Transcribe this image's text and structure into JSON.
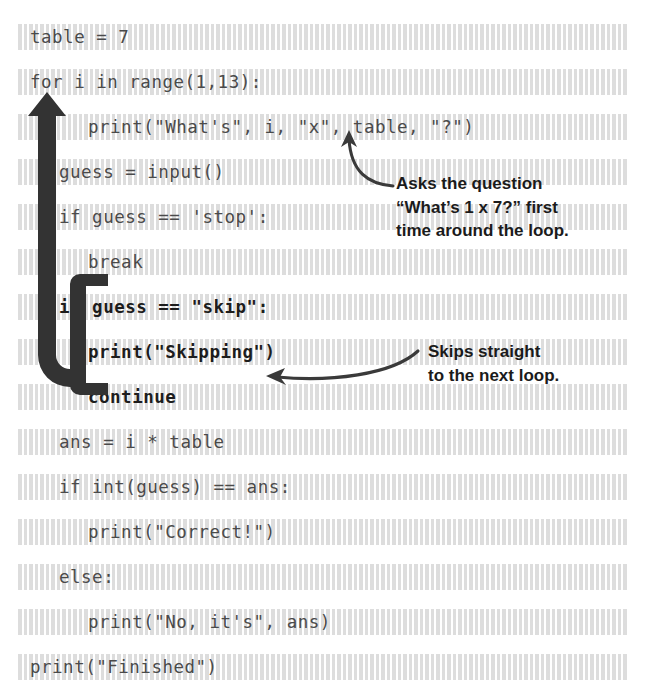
{
  "figure": {
    "kind": "annotated-code-listing",
    "language": "Python",
    "background": "#ffffff",
    "code_color": "#4a4a4a",
    "highlight_color": "#d7d7d7",
    "annotation_color": "#1b1b1b",
    "arrow_color": "#333333"
  },
  "code": {
    "lines": [
      {
        "text": "table = 7",
        "indent": 0,
        "bold": false
      },
      {
        "text": "for i in range(1,13):",
        "indent": 0,
        "bold": false
      },
      {
        "text": "print(\"What's\", i, \"x\", table, \"?\")",
        "indent": 2,
        "bold": false
      },
      {
        "text": "guess = input()",
        "indent": 1,
        "bold": false
      },
      {
        "text": "if guess == 'stop':",
        "indent": 1,
        "bold": false
      },
      {
        "text": "break",
        "indent": 2,
        "bold": false
      },
      {
        "text": "if guess == \"skip\":",
        "indent": 1,
        "bold": true
      },
      {
        "text": "print(\"Skipping\")",
        "indent": 2,
        "bold": true
      },
      {
        "text": "continue",
        "indent": 2,
        "bold": true
      },
      {
        "text": "ans = i * table",
        "indent": 1,
        "bold": false
      },
      {
        "text": "if int(guess) == ans:",
        "indent": 1,
        "bold": false
      },
      {
        "text": "print(\"Correct!\")",
        "indent": 2,
        "bold": false
      },
      {
        "text": "else:",
        "indent": 1,
        "bold": false
      },
      {
        "text": "print(\"No, it's\", ans)",
        "indent": 2,
        "bold": false
      },
      {
        "text": "print(\"Finished\")",
        "indent": 0,
        "bold": false
      }
    ]
  },
  "annotations": [
    {
      "id": "asks-question",
      "lines": [
        "Asks the question",
        "“What’s 1 x 7?” first",
        "time around the loop."
      ],
      "x": 396,
      "y": 172,
      "points_to": "print-what-s-line"
    },
    {
      "id": "skips-straight",
      "lines": [
        "Skips straight",
        "to the next loop."
      ],
      "x": 428,
      "y": 340,
      "points_to": "continue-line"
    }
  ],
  "shapes": {
    "loop_arrow": {
      "name": "loop-back-arrow",
      "direction": "up",
      "color": "#333333"
    },
    "skip_brace": {
      "name": "skip-block-brace",
      "color": "#333333"
    },
    "callout_arrow_1": {
      "name": "callout-arrow-to-x",
      "color": "#3a3a3a"
    },
    "callout_arrow_2": {
      "name": "callout-arrow-to-continue",
      "color": "#3a3a3a"
    }
  }
}
